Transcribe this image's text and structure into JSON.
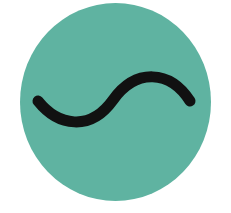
{
  "symbol": {
    "name": "alternating-current",
    "label": "AC sine wave symbol",
    "colors": {
      "background": "#ffffff",
      "disc": "#5fb3a1",
      "wave": "#111111"
    },
    "disc": {
      "cx": 115.5,
      "cy": 102,
      "rx": 95.5,
      "ry": 99
    },
    "wave": {
      "path": "M 38 101 C 58 126, 90 132, 113 100 C 136 68, 170 70, 190 101",
      "stroke_width": 11
    }
  }
}
